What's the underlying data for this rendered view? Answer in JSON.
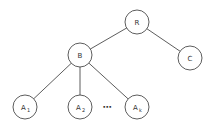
{
  "diagram": {
    "type": "tree",
    "nodes": [
      {
        "id": "R",
        "label": "R",
        "sub": ""
      },
      {
        "id": "B",
        "label": "B",
        "sub": ""
      },
      {
        "id": "C",
        "label": "C",
        "sub": ""
      },
      {
        "id": "A1",
        "label": "A",
        "sub": "1"
      },
      {
        "id": "A2",
        "label": "A",
        "sub": "2"
      },
      {
        "id": "Ak",
        "label": "A",
        "sub": "k"
      }
    ],
    "edges": [
      {
        "from": "R",
        "to": "B"
      },
      {
        "from": "R",
        "to": "C"
      },
      {
        "from": "B",
        "to": "A1"
      },
      {
        "from": "B",
        "to": "A2"
      },
      {
        "from": "B",
        "to": "Ak"
      }
    ],
    "ellipsis": "⋯"
  }
}
